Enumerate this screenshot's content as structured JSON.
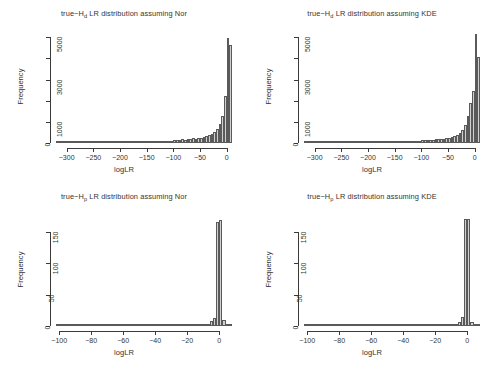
{
  "figure": {
    "background_color": "#ffffff",
    "bar_fill_color": "#d0d0d0",
    "bar_border_color": "#5a5a5a",
    "axis_color": "#3a3a3a",
    "layout": "2x2 grid of histogram panels"
  },
  "chart_data": [
    {
      "type": "bar",
      "panel": "top-left",
      "title": "true−Hd LR distribution assuming Nor",
      "title_prefix": "true−H",
      "title_subscript": "d",
      "title_suffix": " LR distribution assuming Nor",
      "xlabel": "logLR",
      "ylabel": "Frequency",
      "xlim": [
        -320,
        10
      ],
      "ylim": [
        0,
        5200
      ],
      "xticks": [
        -300,
        -250,
        -200,
        -150,
        -100,
        -50,
        0
      ],
      "xtick_labels": [
        "−300",
        "−250",
        "−200",
        "−150",
        "−100",
        "−50",
        "0"
      ],
      "yticks": [
        0,
        1000,
        3000,
        5000
      ],
      "ytick_labels": [
        "0",
        "1000",
        "3000",
        "5000"
      ],
      "yticks_minor": [
        2000,
        4000
      ],
      "grid": false,
      "legend": null,
      "bin_width": 5,
      "bin_starts": [
        -320,
        -315,
        -310,
        -305,
        -300,
        -295,
        -290,
        -285,
        -280,
        -275,
        -270,
        -265,
        -260,
        -255,
        -250,
        -245,
        -240,
        -235,
        -230,
        -225,
        -220,
        -215,
        -210,
        -205,
        -200,
        -195,
        -190,
        -185,
        -180,
        -175,
        -170,
        -165,
        -160,
        -155,
        -150,
        -145,
        -140,
        -135,
        -130,
        -125,
        -120,
        -115,
        -110,
        -105,
        -100,
        -95,
        -90,
        -85,
        -80,
        -75,
        -70,
        -65,
        -60,
        -55,
        -50,
        -45,
        -40,
        -35,
        -30,
        -25,
        -20,
        -15,
        -10,
        -5,
        0,
        5
      ],
      "values": [
        18,
        16,
        20,
        15,
        22,
        18,
        24,
        20,
        26,
        22,
        28,
        24,
        30,
        26,
        32,
        28,
        34,
        30,
        36,
        32,
        38,
        34,
        40,
        36,
        44,
        40,
        48,
        44,
        52,
        48,
        58,
        54,
        62,
        58,
        68,
        64,
        74,
        70,
        82,
        80,
        92,
        96,
        104,
        112,
        124,
        138,
        152,
        168,
        150,
        182,
        196,
        214,
        196,
        232,
        248,
        276,
        310,
        360,
        420,
        520,
        660,
        900,
        1280,
        2220,
        4980,
        4650
      ]
    },
    {
      "type": "bar",
      "panel": "top-right",
      "title": "true−Hd LR distribution assuming KDE",
      "title_prefix": "true−H",
      "title_subscript": "d",
      "title_suffix": " LR distribution assuming KDE",
      "xlabel": "logLR",
      "ylabel": "Frequency",
      "xlim": [
        -320,
        10
      ],
      "ylim": [
        0,
        5200
      ],
      "xticks": [
        -300,
        -250,
        -200,
        -150,
        -100,
        -50,
        0
      ],
      "xtick_labels": [
        "−300",
        "−250",
        "−200",
        "−150",
        "−100",
        "−50",
        "0"
      ],
      "yticks": [
        0,
        1000,
        3000,
        5000
      ],
      "ytick_labels": [
        "0",
        "1000",
        "3000",
        "5000"
      ],
      "yticks_minor": [
        2000,
        4000
      ],
      "grid": false,
      "legend": null,
      "bin_width": 5,
      "bin_starts": [
        -320,
        -315,
        -310,
        -305,
        -300,
        -295,
        -290,
        -285,
        -280,
        -275,
        -270,
        -265,
        -260,
        -255,
        -250,
        -245,
        -240,
        -235,
        -230,
        -225,
        -220,
        -215,
        -210,
        -205,
        -200,
        -195,
        -190,
        -185,
        -180,
        -175,
        -170,
        -165,
        -160,
        -155,
        -150,
        -145,
        -140,
        -135,
        -130,
        -125,
        -120,
        -115,
        -110,
        -105,
        -100,
        -95,
        -90,
        -85,
        -80,
        -75,
        -70,
        -65,
        -60,
        -55,
        -50,
        -45,
        -40,
        -35,
        -30,
        -25,
        -20,
        -15,
        -10,
        -5,
        0,
        5
      ],
      "values": [
        16,
        14,
        18,
        16,
        20,
        18,
        22,
        20,
        24,
        22,
        26,
        24,
        28,
        26,
        30,
        28,
        32,
        30,
        34,
        32,
        36,
        34,
        38,
        36,
        42,
        38,
        46,
        42,
        50,
        46,
        56,
        52,
        60,
        56,
        66,
        62,
        72,
        68,
        80,
        78,
        90,
        94,
        102,
        110,
        122,
        136,
        150,
        166,
        148,
        180,
        194,
        212,
        194,
        230,
        250,
        280,
        320,
        380,
        460,
        600,
        840,
        1260,
        1880,
        2480,
        5130,
        4050
      ]
    },
    {
      "type": "bar",
      "panel": "bottom-left",
      "title": "true−Hp LR distribution assuming Nor",
      "title_prefix": "true−H",
      "title_subscript": "p",
      "title_suffix": " LR distribution assuming Nor",
      "xlabel": "logLR",
      "ylabel": "Frequency",
      "xlim": [
        -102,
        8
      ],
      "ylim": [
        0,
        175
      ],
      "xticks": [
        -100,
        -80,
        -60,
        -40,
        -20,
        0
      ],
      "xtick_labels": [
        "−100",
        "−80",
        "−60",
        "−40",
        "−20",
        "0"
      ],
      "yticks": [
        0,
        50,
        100,
        150
      ],
      "ytick_labels": [
        "0",
        "50",
        "100",
        "150"
      ],
      "grid": false,
      "legend": null,
      "bin_width": 2,
      "bin_starts": [
        -102,
        -100,
        -98,
        -96,
        -94,
        -92,
        -90,
        -88,
        -86,
        -84,
        -82,
        -80,
        -78,
        -76,
        -74,
        -72,
        -70,
        -68,
        -66,
        -64,
        -62,
        -60,
        -58,
        -56,
        -54,
        -52,
        -50,
        -48,
        -46,
        -44,
        -42,
        -40,
        -38,
        -36,
        -34,
        -32,
        -30,
        -28,
        -26,
        -24,
        -22,
        -20,
        -18,
        -16,
        -14,
        -12,
        -10,
        -8,
        -6,
        -4,
        -2,
        0,
        2,
        4,
        6
      ],
      "values": [
        1,
        1,
        0,
        1,
        1,
        0,
        0,
        0,
        0,
        0,
        0,
        0,
        0,
        0,
        0,
        0,
        0,
        0,
        0,
        0,
        0,
        0,
        0,
        0,
        0,
        0,
        0,
        0,
        0,
        0,
        0,
        0,
        0,
        0,
        0,
        0,
        0,
        0,
        0,
        1,
        1,
        0,
        1,
        2,
        0,
        1,
        1,
        2,
        8,
        12,
        166,
        168,
        9,
        3,
        1
      ]
    },
    {
      "type": "bar",
      "panel": "bottom-right",
      "title": "true−Hp LR distribution assuming KDE",
      "title_prefix": "true−H",
      "title_subscript": "p",
      "title_suffix": " LR distribution assuming KDE",
      "xlabel": "logLR",
      "ylabel": "Frequency",
      "xlim": [
        -102,
        8
      ],
      "ylim": [
        0,
        175
      ],
      "xticks": [
        -100,
        -80,
        -60,
        -40,
        -20,
        0
      ],
      "xtick_labels": [
        "−100",
        "−80",
        "−60",
        "−40",
        "−20",
        "0"
      ],
      "yticks": [
        0,
        50,
        100,
        150
      ],
      "ytick_labels": [
        "0",
        "50",
        "100",
        "150"
      ],
      "grid": false,
      "legend": null,
      "bin_width": 2,
      "bin_starts": [
        -102,
        -100,
        -98,
        -96,
        -94,
        -92,
        -90,
        -88,
        -86,
        -84,
        -82,
        -80,
        -78,
        -76,
        -74,
        -72,
        -70,
        -68,
        -66,
        -64,
        -62,
        -60,
        -58,
        -56,
        -54,
        -52,
        -50,
        -48,
        -46,
        -44,
        -42,
        -40,
        -38,
        -36,
        -34,
        -32,
        -30,
        -28,
        -26,
        -24,
        -22,
        -20,
        -18,
        -16,
        -14,
        -12,
        -10,
        -8,
        -6,
        -4,
        -2,
        0,
        2,
        4,
        6
      ],
      "values": [
        1,
        1,
        1,
        0,
        1,
        0,
        0,
        0,
        0,
        0,
        0,
        0,
        0,
        0,
        0,
        0,
        0,
        0,
        0,
        0,
        0,
        0,
        0,
        0,
        0,
        0,
        0,
        0,
        0,
        0,
        0,
        0,
        0,
        0,
        0,
        0,
        0,
        0,
        0,
        1,
        1,
        1,
        0,
        2,
        0,
        1,
        1,
        2,
        7,
        14,
        170,
        170,
        6,
        3,
        1
      ]
    }
  ]
}
